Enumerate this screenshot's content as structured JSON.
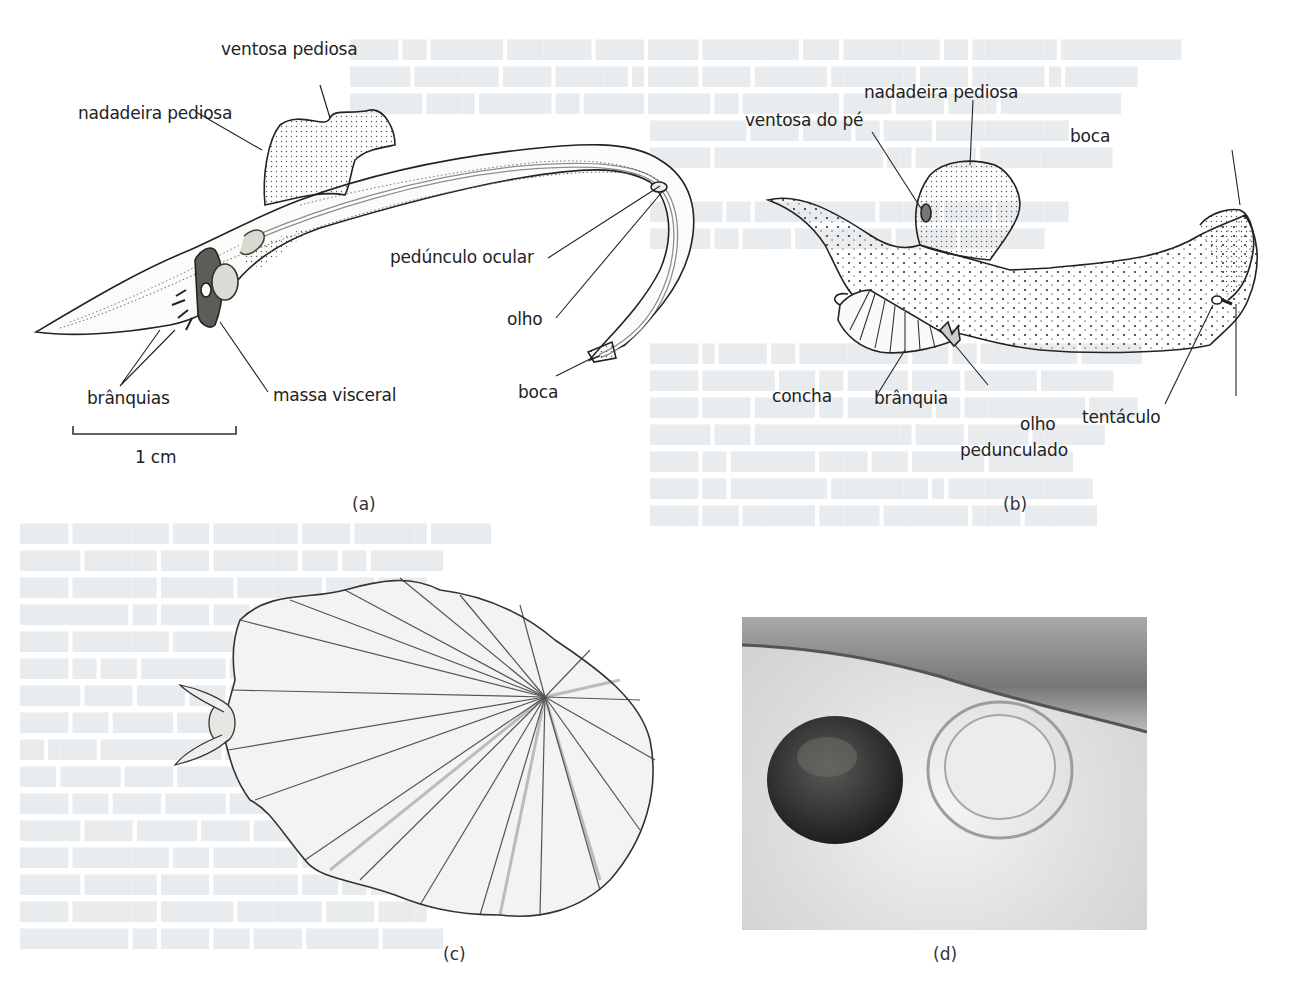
{
  "figure": {
    "panels": [
      {
        "id": "a",
        "caption": "(a)",
        "labels": {
          "ventosa_pediosa": "ventosa pediosa",
          "nadadeira_pediosa": "nadadeira pediosa",
          "pedunculo_ocular": "pedúnculo ocular",
          "olho": "olho",
          "boca": "boca",
          "branquias": "brânquias",
          "massa_visceral": "massa visceral"
        },
        "scale_bar": "1 cm"
      },
      {
        "id": "b",
        "caption": "(b)",
        "labels": {
          "nadadeira_pediosa": "nadadeira pediosa",
          "ventosa_do_pe": "ventosa do pé",
          "boca": "boca",
          "concha": "concha",
          "branquia": "brânquia",
          "olho_pedunculado_1": "olho",
          "olho_pedunculado_2": "pedunculado",
          "tentaculo": "tentáculo"
        }
      },
      {
        "id": "c",
        "caption": "(c)"
      },
      {
        "id": "d",
        "caption": "(d)"
      }
    ]
  }
}
